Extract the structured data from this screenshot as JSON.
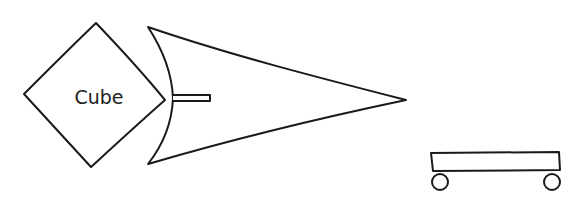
{
  "diagram": {
    "nodes": [
      {
        "id": "cube",
        "shape": "diamond",
        "label": "Cube"
      },
      {
        "id": "arrow",
        "shape": "arrowhead-with-stub",
        "label": ""
      },
      {
        "id": "cart",
        "shape": "cart",
        "label": ""
      }
    ],
    "colors": {
      "stroke": "#1a1a1a",
      "fill": "#ffffff",
      "background": "#ffffff",
      "text": "#222222"
    }
  }
}
